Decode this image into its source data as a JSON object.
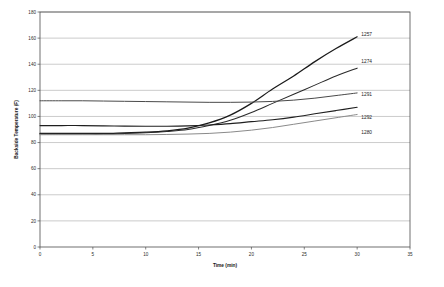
{
  "chart_data": {
    "type": "line",
    "title": "",
    "xlabel": "Time (min)",
    "ylabel": "Backside Temperature (F)",
    "xlim": [
      0,
      35
    ],
    "ylim": [
      0,
      180
    ],
    "xticks": [
      0,
      5,
      10,
      15,
      20,
      25,
      30,
      35
    ],
    "xtick_labels": [
      "0",
      "5",
      "10",
      "15",
      "20",
      "25",
      "30",
      "35"
    ],
    "yticks": [
      0,
      20,
      40,
      60,
      80,
      100,
      120,
      140,
      160,
      180
    ],
    "ytick_labels": [
      "0",
      "20",
      "40",
      "60",
      "80",
      "100",
      "120",
      "140",
      "160",
      "180"
    ],
    "grid": "horizontal",
    "legend_position": "right-inline-labels",
    "x": [
      0,
      2,
      4,
      6,
      8,
      10,
      12,
      14,
      16,
      18,
      20,
      22,
      24,
      26,
      28,
      30
    ],
    "series": [
      {
        "name": "1257",
        "color": "#1a1a1a",
        "width": 1.25,
        "label_x": 30.4,
        "label_y": 163,
        "values": [
          87,
          87,
          87,
          87,
          87.5,
          88,
          89,
          91,
          95,
          101,
          110,
          121,
          131,
          142,
          152,
          161
        ]
      },
      {
        "name": "1274",
        "color": "#2a2a2a",
        "width": 1.05,
        "label_x": 30.4,
        "label_y": 142,
        "values": [
          86.5,
          86.5,
          86.5,
          86.5,
          87,
          87.5,
          88.5,
          90,
          93,
          97,
          103,
          110,
          117,
          124,
          131,
          137
        ]
      },
      {
        "name": "1291",
        "color": "#4a4a4a",
        "width": 1.0,
        "label_x": 30.4,
        "label_y": 117,
        "values": [
          112,
          112,
          112,
          111.8,
          111.6,
          111.4,
          111.2,
          111,
          110.8,
          110.8,
          111,
          111.5,
          112.5,
          114,
          116,
          118
        ]
      },
      {
        "name": "1292",
        "color": "#1f1f1f",
        "width": 1.1,
        "label_x": 30.4,
        "label_y": 99,
        "values": [
          93,
          93,
          93,
          92.8,
          92.6,
          92.5,
          92.5,
          92.8,
          93.5,
          94.5,
          96,
          97.5,
          99.5,
          102,
          104.5,
          107
        ]
      },
      {
        "name": "1280",
        "color": "#8a8a8a",
        "width": 1.0,
        "label_x": 30.4,
        "label_y": 88,
        "values": [
          86,
          86,
          86,
          86,
          86,
          86,
          86.2,
          86.5,
          87,
          88,
          89.5,
          91.5,
          94,
          96.5,
          99,
          101.5
        ]
      }
    ]
  },
  "layout": {
    "plot_left": 40,
    "plot_right": 410,
    "plot_top": 12,
    "plot_bottom": 247,
    "width": 444,
    "height": 287
  }
}
